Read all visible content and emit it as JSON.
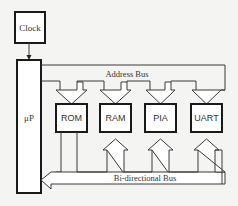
{
  "diagram": {
    "clock": {
      "label": "Clock"
    },
    "cpu": {
      "label": "μP"
    },
    "components": [
      {
        "label": "ROM"
      },
      {
        "label": "RAM"
      },
      {
        "label": "PIA"
      },
      {
        "label": "UART"
      }
    ],
    "buses": {
      "address": {
        "label": "Address Bus"
      },
      "data": {
        "label": "Bi-directional Bus"
      }
    },
    "colors": {
      "background": "#f4f4f2",
      "box_stroke": "#1a1a1a",
      "line": "#3a3a3a",
      "text": "#333333"
    }
  }
}
